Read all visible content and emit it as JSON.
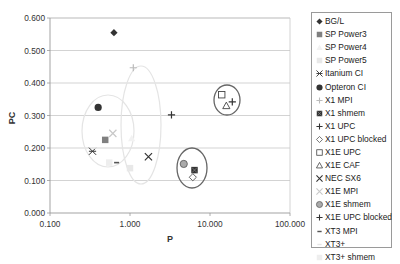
{
  "chart_data": {
    "type": "scatter",
    "title": "",
    "xlabel": "P",
    "ylabel": "PC",
    "xscale": "log",
    "xlim": [
      0.1,
      100
    ],
    "ylim": [
      0,
      0.6
    ],
    "xticks": [
      "0.100",
      "1.000",
      "10.000",
      "100.000"
    ],
    "yticks": [
      "0.000",
      "0.100",
      "0.200",
      "0.300",
      "0.400",
      "0.500",
      "0.600"
    ],
    "grid": "horizontal",
    "legend_position": "right",
    "series": [
      {
        "name": "BG/L",
        "marker": "diamond",
        "color": "#333333",
        "x": 0.63,
        "y": 0.555
      },
      {
        "name": "SP Power3",
        "marker": "square",
        "color": "#808080",
        "x": 0.49,
        "y": 0.225
      },
      {
        "name": "SP Power4",
        "marker": "triangle",
        "color": "#f2f2f2",
        "x": 1.05,
        "y": 0.23
      },
      {
        "name": "SP Power5",
        "marker": "square",
        "color": "#e8e8e8",
        "x": 1.0,
        "y": 0.138
      },
      {
        "name": "Itanium CI",
        "marker": "asterisk",
        "color": "#333333",
        "x": 0.34,
        "y": 0.19
      },
      {
        "name": "Opteron CI",
        "marker": "circle",
        "color": "#333333",
        "x": 0.4,
        "y": 0.325
      },
      {
        "name": "X1 MPI",
        "marker": "plus",
        "color": "#bbbbbb",
        "x": 1.1,
        "y": 0.447
      },
      {
        "name": "X1 shmem",
        "marker": "square-x",
        "color": "#333333",
        "x": 6.4,
        "y": 0.132
      },
      {
        "name": "X1 UPC",
        "marker": "plus",
        "color": "#333333",
        "x": 3.3,
        "y": 0.302
      },
      {
        "name": "X1 UPC blocked",
        "marker": "diamond-open",
        "color": "#555555",
        "x": 6.1,
        "y": 0.11
      },
      {
        "name": "X1E UPC",
        "marker": "square-open",
        "color": "#444444",
        "x": 14.0,
        "y": 0.364
      },
      {
        "name": "X1E CAF",
        "marker": "triangle-open",
        "color": "#444444",
        "x": 16.0,
        "y": 0.33
      },
      {
        "name": "NEC SX6",
        "marker": "x",
        "color": "#333333",
        "x": 1.7,
        "y": 0.173
      },
      {
        "name": "X1E MPI",
        "marker": "x",
        "color": "#c8c8c8",
        "x": 0.61,
        "y": 0.245
      },
      {
        "name": "X1E shmem",
        "marker": "circle-gray",
        "color": "#aaaaaa",
        "x": 4.7,
        "y": 0.151
      },
      {
        "name": "X1E UPC blocked",
        "marker": "plus",
        "color": "#333333",
        "x": 19.0,
        "y": 0.342
      },
      {
        "name": "XT3 MPI",
        "marker": "dash",
        "color": "#555555",
        "x": 0.68,
        "y": 0.155
      },
      {
        "name": "XT3+",
        "marker": "dash",
        "color": "#e6e6e6",
        "x": 0.36,
        "y": 0.2
      },
      {
        "name": "XT3+ shmem",
        "marker": "square",
        "color": "#eeeeee",
        "x": 0.55,
        "y": 0.155
      }
    ],
    "annotations": [
      {
        "type": "ellipse",
        "color": "#e4e4e4",
        "cx_px": 108,
        "cy_px": 131,
        "rx_px": 26,
        "ry_px": 36
      },
      {
        "type": "ellipse",
        "color": "#e4e4e4",
        "cx_px": 141,
        "cy_px": 125,
        "rx_px": 20,
        "ry_px": 59
      },
      {
        "type": "ellipse",
        "color": "#666666",
        "cx_px": 192,
        "cy_px": 168,
        "rx_px": 15,
        "ry_px": 20
      },
      {
        "type": "ellipse",
        "color": "#666666",
        "cx_px": 227,
        "cy_px": 100,
        "rx_px": 13,
        "ry_px": 15
      }
    ]
  }
}
